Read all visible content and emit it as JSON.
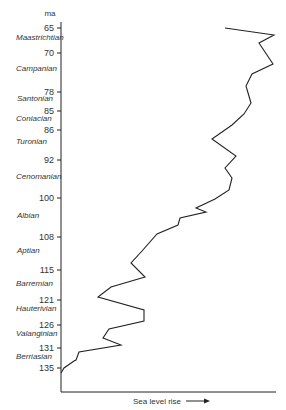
{
  "chart_data": {
    "type": "line",
    "title": "",
    "ylabel": "ma",
    "xlabel": "Sea level rise",
    "orientation": "vertical-time-axis",
    "y_axis_ticks": [
      65,
      70,
      78,
      85,
      86,
      92,
      100,
      108,
      115,
      121,
      126,
      131,
      135
    ],
    "stages": [
      {
        "name": "Maastrichtian",
        "from": 65,
        "to": 70
      },
      {
        "name": "Campanian",
        "from": 70,
        "to": 78
      },
      {
        "name": "Santonian",
        "from": 78,
        "to": 85
      },
      {
        "name": "Coniacian",
        "from": 85,
        "to": 86
      },
      {
        "name": "Turonian",
        "from": 86,
        "to": 92
      },
      {
        "name": "Cenomanian",
        "from": 92,
        "to": 100
      },
      {
        "name": "Albian",
        "from": 100,
        "to": 108
      },
      {
        "name": "Aptian",
        "from": 108,
        "to": 115
      },
      {
        "name": "Barremian",
        "from": 115,
        "to": 121
      },
      {
        "name": "Hauterivian",
        "from": 121,
        "to": 126
      },
      {
        "name": "Valanginian",
        "from": 126,
        "to": 131
      },
      {
        "name": "Berriasian",
        "from": 131,
        "to": 135
      }
    ],
    "series": [
      {
        "name": "Sea level curve",
        "points_px": [
          [
            225,
            28
          ],
          [
            274,
            35
          ],
          [
            259,
            43
          ],
          [
            273,
            64
          ],
          [
            252,
            74
          ],
          [
            246,
            86
          ],
          [
            251,
            103
          ],
          [
            244,
            114
          ],
          [
            232,
            125
          ],
          [
            212,
            139
          ],
          [
            236,
            156
          ],
          [
            225,
            168
          ],
          [
            232,
            178
          ],
          [
            229,
            190
          ],
          [
            215,
            199
          ],
          [
            196,
            208
          ],
          [
            206,
            212
          ],
          [
            180,
            218
          ],
          [
            178,
            225
          ],
          [
            157,
            234
          ],
          [
            142,
            251
          ],
          [
            131,
            263
          ],
          [
            145,
            277
          ],
          [
            111,
            287
          ],
          [
            98,
            297
          ],
          [
            144,
            310
          ],
          [
            144,
            321
          ],
          [
            109,
            329
          ],
          [
            103,
            338
          ],
          [
            121,
            345
          ],
          [
            79,
            352
          ],
          [
            76,
            360
          ],
          [
            74,
            361
          ],
          [
            64,
            368
          ],
          [
            61,
            373
          ]
        ]
      }
    ],
    "grid": false,
    "legend": null
  },
  "axis": {
    "unit": "ma",
    "x_label": "Sea level rise"
  }
}
